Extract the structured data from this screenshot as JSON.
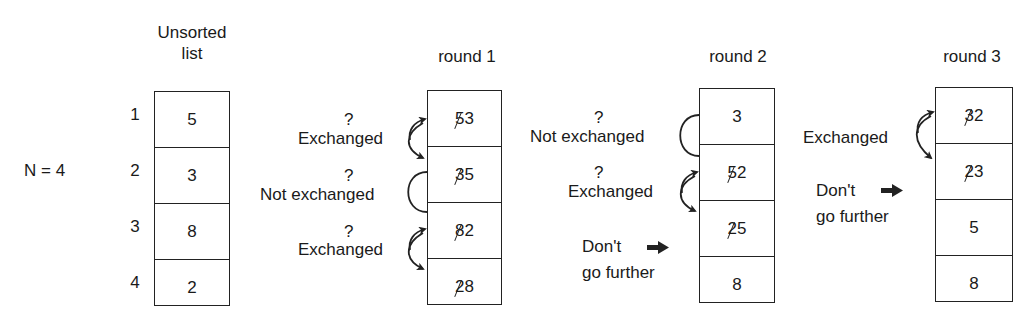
{
  "n_label": "N = 4",
  "unsorted": {
    "title_line1": "Unsorted",
    "title_line2": "list",
    "indices": [
      "1",
      "2",
      "3",
      "4"
    ],
    "values": [
      "5",
      "3",
      "8",
      "2"
    ]
  },
  "rounds": [
    {
      "title": "round 1",
      "cells": [
        {
          "old": "5",
          "new": "3"
        },
        {
          "old": "3",
          "new": "5"
        },
        {
          "old": "8",
          "new": "2"
        },
        {
          "old": "2",
          "new": "8"
        }
      ],
      "annotations": [
        {
          "q": "?",
          "text": "Exchanged",
          "type": "exchanged"
        },
        {
          "q": "?",
          "text": "Not exchanged",
          "type": "not-exchanged"
        },
        {
          "q": "?",
          "text": "Exchanged",
          "type": "exchanged"
        }
      ]
    },
    {
      "title": "round 2",
      "cells": [
        {
          "old": "",
          "new": "3"
        },
        {
          "old": "5",
          "new": "2"
        },
        {
          "old": "2",
          "new": "5"
        },
        {
          "old": "",
          "new": "8"
        }
      ],
      "annotations": [
        {
          "q": "?",
          "text": "Not exchanged",
          "type": "not-exchanged"
        },
        {
          "q": "?",
          "text": "Exchanged",
          "type": "exchanged"
        }
      ],
      "stop_line1": "Don't",
      "stop_line2": "go further"
    },
    {
      "title": "round 3",
      "cells": [
        {
          "old": "3",
          "new": "2"
        },
        {
          "old": "2",
          "new": "3"
        },
        {
          "old": "",
          "new": "5"
        },
        {
          "old": "",
          "new": "8"
        }
      ],
      "annotations": [
        {
          "q": "",
          "text": "Exchanged",
          "type": "exchanged"
        }
      ],
      "stop_line1": "Don't",
      "stop_line2": "go further"
    }
  ]
}
